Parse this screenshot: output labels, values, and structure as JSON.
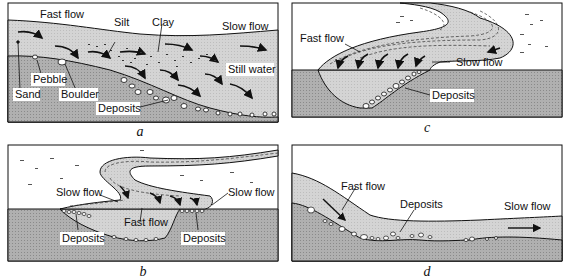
{
  "colors": {
    "water": "#cfcfcf",
    "ground": "#a6a6a6",
    "sky": "#ffffff",
    "line": "#111111"
  },
  "panels": {
    "a": {
      "caption": "a",
      "labels": {
        "fast_flow": "Fast flow",
        "silt": "Silt",
        "clay": "Clay",
        "slow_flow": "Slow flow",
        "still_water": "Still water",
        "pebble": "Pebble",
        "sand": "Sand",
        "boulder": "Boulder",
        "deposits": "Deposits"
      }
    },
    "b": {
      "caption": "b",
      "labels": {
        "slow_flow_left": "Slow flow",
        "slow_flow_right": "Slow flow",
        "fast_flow": "Fast flow",
        "deposits_left": "Deposits",
        "deposits_right": "Deposits"
      }
    },
    "c": {
      "caption": "c",
      "labels": {
        "fast_flow": "Fast flow",
        "slow_flow": "Slow flow",
        "deposits": "Deposits"
      }
    },
    "d": {
      "caption": "d",
      "labels": {
        "fast_flow": "Fast flow",
        "deposits": "Deposits",
        "slow_flow": "Slow flow"
      }
    }
  }
}
